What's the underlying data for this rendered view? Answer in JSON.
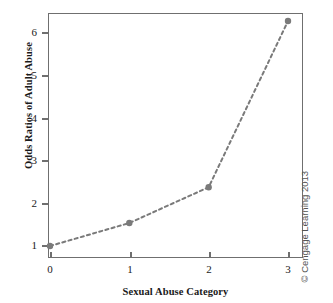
{
  "chart_data": {
    "type": "line",
    "title": "",
    "xlabel": "Sexual Abuse Category",
    "ylabel": "Odds Ratios of Adult Abuse",
    "x": [
      0,
      1,
      2,
      3
    ],
    "values": [
      1.0,
      1.54,
      2.38,
      6.28
    ],
    "categories": [
      "0",
      "1",
      "2",
      "3"
    ],
    "xticks": [
      "0",
      "1",
      "2",
      "3"
    ],
    "yticks": [
      "1",
      "2",
      "3",
      "4",
      "5",
      "6"
    ],
    "xlim": [
      -0.03,
      3.19
    ],
    "ylim": [
      0.72,
      6.47
    ],
    "grid": false,
    "legend": null,
    "line_style": "dashed",
    "marker": "circle",
    "series_color": "#7a7a7a"
  },
  "axes": {
    "y_title": "Odds Ratios of Adult Abuse",
    "x_title": "Sexual Abuse Category",
    "y_tick_labels": [
      "6",
      "5",
      "4",
      "3",
      "2",
      "1"
    ],
    "x_tick_labels": [
      "0",
      "1",
      "2",
      "3"
    ]
  },
  "credit": {
    "text": "© Cengage Learning 2013"
  },
  "colors": {
    "frame": "#6f6f6f",
    "series": "#7a7a7a",
    "background": "#ffffff",
    "text": "#1a1a1a"
  }
}
